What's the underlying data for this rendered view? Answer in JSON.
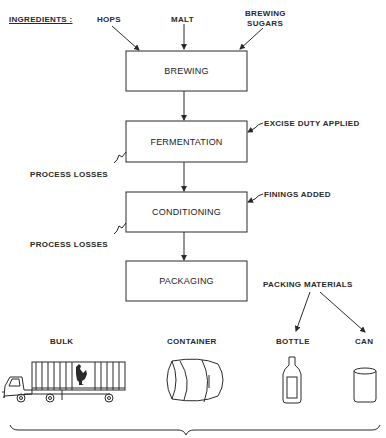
{
  "diagram": {
    "ingredients_label": "INGREDIENTS :",
    "ingredients": [
      {
        "label": "HOPS"
      },
      {
        "label": "MALT"
      },
      {
        "label_line1": "BREWING",
        "label_line2": "SUGARS"
      }
    ],
    "process_steps": [
      {
        "label": "BREWING"
      },
      {
        "label": "FERMENTATION"
      },
      {
        "label": "CONDITIONING"
      },
      {
        "label": "PACKAGING"
      }
    ],
    "annotations": {
      "excise": "EXCISE DUTY APPLIED",
      "finings": "FININGS ADDED",
      "losses_1": "PROCESS LOSSES",
      "losses_2": "PROCESS LOSSES",
      "packing_materials": "PACKING MATERIALS"
    },
    "outputs": [
      {
        "label": "BULK",
        "icon": "truck-icon"
      },
      {
        "label": "CONTAINER",
        "icon": "barrel-icon"
      },
      {
        "label": "BOTTLE",
        "icon": "bottle-icon"
      },
      {
        "label": "CAN",
        "icon": "can-icon"
      }
    ],
    "colors": {
      "ink": "#2a2a2a",
      "background": "#ffffff"
    }
  }
}
